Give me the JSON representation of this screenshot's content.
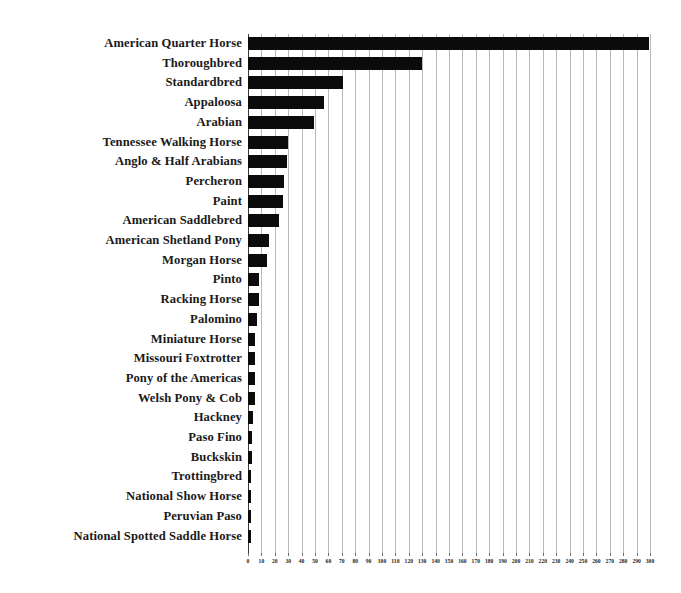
{
  "chart_data": {
    "type": "bar",
    "orientation": "horizontal",
    "title": "",
    "subtitle": "",
    "xlabel": "",
    "ylabel": "",
    "xlim": [
      0,
      300
    ],
    "ylim": null,
    "grid": true,
    "legend": null,
    "legend_position": "none",
    "xticks": [
      0,
      10,
      20,
      30,
      40,
      50,
      60,
      70,
      80,
      90,
      100,
      110,
      120,
      130,
      140,
      150,
      160,
      170,
      180,
      190,
      200,
      210,
      220,
      230,
      240,
      250,
      260,
      270,
      280,
      290,
      300
    ],
    "xtick_labels": [
      "0",
      "10",
      "20",
      "30",
      "40",
      "50",
      "60",
      "70",
      "80",
      "90",
      "100",
      "110",
      "120",
      "130",
      "140",
      "150",
      "160",
      "170",
      "180",
      "190",
      "200",
      "210",
      "220",
      "230",
      "240",
      "250",
      "260",
      "270",
      "280",
      "290",
      "300"
    ],
    "bar_color": "#0b0b0b",
    "gridline_color": "#b9b9b9",
    "axis_color": "#3a3a3a",
    "categories": [
      "American Quarter Horse",
      "Thoroughbred",
      "Standardbred",
      "Appaloosa",
      "Arabian",
      "Tennessee Walking Horse",
      "Anglo & Half Arabians",
      "Percheron",
      "Paint",
      "American Saddlebred",
      "American Shetland Pony",
      "Morgan Horse",
      "Pinto",
      "Racking Horse",
      "Palomino",
      "Miniature Horse",
      "Missouri Foxtrotter",
      "Pony of the Americas",
      "Welsh Pony & Cob",
      "Hackney",
      "Paso Fino",
      "Buckskin",
      "Trottingbred",
      "National Show Horse",
      "Peruvian Paso",
      "National Spotted Saddle Horse"
    ],
    "values": [
      299,
      130,
      71,
      57,
      49,
      30,
      29,
      27,
      26,
      23,
      16,
      14,
      8,
      8,
      7,
      5,
      5,
      5,
      5,
      4,
      3,
      3,
      2,
      2,
      2,
      2
    ]
  }
}
